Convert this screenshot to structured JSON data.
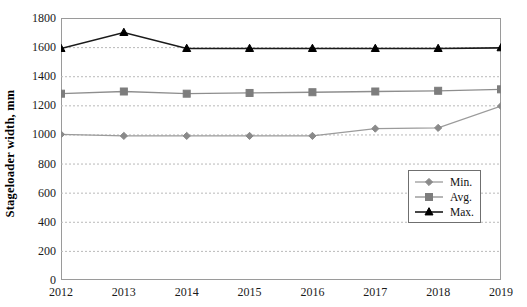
{
  "chart_data": {
    "type": "line",
    "title": "",
    "xlabel": "",
    "ylabel": "Stageloader width, mm",
    "categories": [
      "2012",
      "2013",
      "2014",
      "2015",
      "2016",
      "2017",
      "2018",
      "2019"
    ],
    "x": [
      2012,
      2013,
      2014,
      2015,
      2016,
      2017,
      2018,
      2019
    ],
    "ylim": [
      0,
      1800
    ],
    "ytick_step": 200,
    "yticks": [
      "0",
      "200",
      "400",
      "600",
      "800",
      "1000",
      "1200",
      "1400",
      "1600",
      "1800"
    ],
    "grid": "horizontal-dotted",
    "legend_position": "inside-right-center",
    "series": [
      {
        "name": "Min.",
        "marker": "diamond",
        "color": "#8a8a8a",
        "line_color": "#9b9b9b",
        "values": [
          1000,
          990,
          990,
          990,
          990,
          1040,
          1045,
          1195
        ]
      },
      {
        "name": "Avg.",
        "marker": "square",
        "color": "#7d7d7d",
        "line_color": "#8e8e8e",
        "values": [
          1280,
          1295,
          1280,
          1285,
          1290,
          1295,
          1300,
          1310
        ]
      },
      {
        "name": "Max.",
        "marker": "triangle",
        "color": "#000000",
        "line_color": "#1a1a1a",
        "values": [
          1590,
          1700,
          1590,
          1590,
          1590,
          1590,
          1590,
          1595
        ]
      }
    ]
  },
  "legend": {
    "entries": [
      {
        "label": "Min."
      },
      {
        "label": "Avg."
      },
      {
        "label": "Max."
      }
    ]
  },
  "axis": {
    "y_title": "Stageloader width, mm"
  },
  "colors": {
    "frame": "#9a9a9a",
    "gridline": "#b9b9b9",
    "background": "#ffffff",
    "min_series": "#8a8a8a",
    "avg_series": "#7d7d7d",
    "max_series": "#000000"
  }
}
